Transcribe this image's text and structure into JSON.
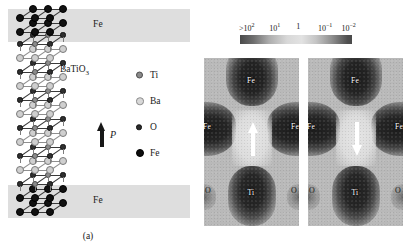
{
  "figure": {
    "panel_a": {
      "caption": "(a)",
      "layer_labels": {
        "top": "Fe",
        "bottom": "Fe"
      },
      "material_label": "BaTiO",
      "material_subscript": "3",
      "polarization_symbol": "P",
      "polarization_direction": "up",
      "legend": [
        {
          "species": "Ti",
          "label": "Ti",
          "color": "#8a8a8a",
          "size": "large"
        },
        {
          "species": "Ba",
          "label": "Ba",
          "color": "#d8d8d8",
          "size": "large"
        },
        {
          "species": "O",
          "label": "O",
          "color": "#2b2b2b",
          "size": "small"
        },
        {
          "species": "Fe",
          "label": "Fe",
          "color": "#0d0d0d",
          "size": "large"
        }
      ]
    },
    "panel_b": {
      "caption": "(b)",
      "colorbar": {
        "ticks": [
          {
            "text": ">10",
            "sup": "2",
            "pos_pct": 6
          },
          {
            "text": "10",
            "sup": "1",
            "pos_pct": 31
          },
          {
            "text": "1",
            "sup": "",
            "pos_pct": 52
          },
          {
            "text": "10",
            "sup": "-1",
            "pos_pct": 76
          },
          {
            "text": "10",
            "sup": "-2",
            "pos_pct": 97
          }
        ],
        "low_color": "#4a4a4a",
        "mid_color": "#e2e2e2",
        "high_color": "#4f4f4f"
      },
      "maps": [
        {
          "id": "left",
          "arrow_direction": "up",
          "labels": {
            "fe_top": "Fe",
            "fe_left": "Fe",
            "fe_right": "Fe",
            "ti": "Ti",
            "o_left": "O",
            "o_right": "O"
          }
        },
        {
          "id": "right",
          "arrow_direction": "down",
          "labels": {
            "fe_top": "Fe",
            "fe_left": "Fe",
            "fe_right": "Fe",
            "ti": "Ti",
            "o_left": "O",
            "o_right": "O"
          }
        }
      ]
    }
  }
}
